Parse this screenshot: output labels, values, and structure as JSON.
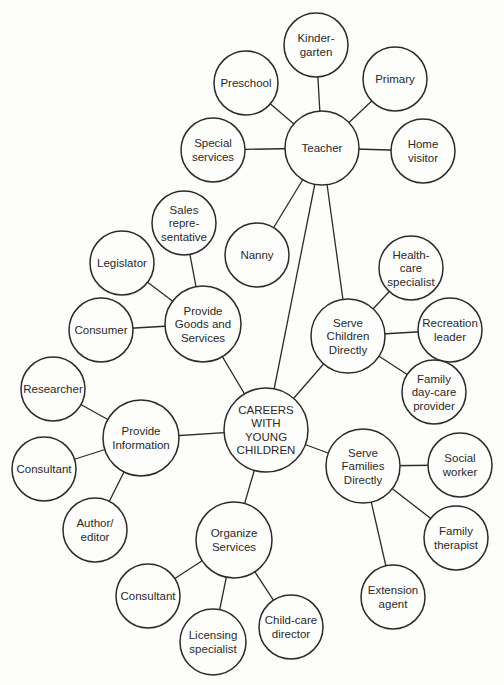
{
  "colors": {
    "line": "#2b2b2b",
    "background": "#fdfdfb",
    "text": "#2a2a2a"
  },
  "nodes": [
    {
      "id": "center",
      "lines": [
        "CAREERS",
        "WITH",
        "YOUNG",
        "CHILDREN"
      ]
    },
    {
      "id": "teacher",
      "lines": [
        "Teacher"
      ]
    },
    {
      "id": "kindergarten",
      "lines": [
        "Kinder-",
        "garten"
      ]
    },
    {
      "id": "preschool",
      "lines": [
        "Preschool"
      ]
    },
    {
      "id": "primary",
      "lines": [
        "Primary"
      ]
    },
    {
      "id": "special-services",
      "lines": [
        "Special",
        "services"
      ]
    },
    {
      "id": "home-visitor",
      "lines": [
        "Home",
        "visitor"
      ]
    },
    {
      "id": "nanny",
      "lines": [
        "Nanny"
      ]
    },
    {
      "id": "goods-services",
      "lines": [
        "Provide",
        "Goods and",
        "Services"
      ]
    },
    {
      "id": "sales-rep",
      "lines": [
        "Sales",
        "repre-",
        "sentative"
      ]
    },
    {
      "id": "legislator",
      "lines": [
        "Legislator"
      ]
    },
    {
      "id": "consumer",
      "lines": [
        "Consumer"
      ]
    },
    {
      "id": "serve-children",
      "lines": [
        "Serve",
        "Children",
        "Directly"
      ]
    },
    {
      "id": "health-care",
      "lines": [
        "Health-",
        "care",
        "specialist"
      ]
    },
    {
      "id": "recreation",
      "lines": [
        "Recreation",
        "leader"
      ]
    },
    {
      "id": "family-daycare",
      "lines": [
        "Family",
        "day-care",
        "provider"
      ]
    },
    {
      "id": "provide-info",
      "lines": [
        "Provide",
        "Information"
      ]
    },
    {
      "id": "researcher",
      "lines": [
        "Researcher"
      ]
    },
    {
      "id": "consultant-info",
      "lines": [
        "Consultant"
      ]
    },
    {
      "id": "author-editor",
      "lines": [
        "Author/",
        "editor"
      ]
    },
    {
      "id": "serve-families",
      "lines": [
        "Serve",
        "Families",
        "Directly"
      ]
    },
    {
      "id": "social-worker",
      "lines": [
        "Social",
        "worker"
      ]
    },
    {
      "id": "family-therapist",
      "lines": [
        "Family",
        "therapist"
      ]
    },
    {
      "id": "extension-agent",
      "lines": [
        "Extension",
        "agent"
      ]
    },
    {
      "id": "organize-services",
      "lines": [
        "Organize",
        "Services"
      ]
    },
    {
      "id": "consultant-org",
      "lines": [
        "Consultant"
      ]
    },
    {
      "id": "licensing",
      "lines": [
        "Licensing",
        "specialist"
      ]
    },
    {
      "id": "child-care-director",
      "lines": [
        "Child-care",
        "director"
      ]
    }
  ],
  "edges": [
    [
      "center",
      "teacher"
    ],
    [
      "center",
      "goods-services"
    ],
    [
      "center",
      "serve-children"
    ],
    [
      "center",
      "provide-info"
    ],
    [
      "center",
      "serve-families"
    ],
    [
      "center",
      "organize-services"
    ],
    [
      "teacher",
      "kindergarten"
    ],
    [
      "teacher",
      "preschool"
    ],
    [
      "teacher",
      "primary"
    ],
    [
      "teacher",
      "special-services"
    ],
    [
      "teacher",
      "home-visitor"
    ],
    [
      "teacher",
      "nanny"
    ],
    [
      "teacher",
      "serve-children"
    ],
    [
      "goods-services",
      "sales-rep"
    ],
    [
      "goods-services",
      "legislator"
    ],
    [
      "goods-services",
      "consumer"
    ],
    [
      "serve-children",
      "health-care"
    ],
    [
      "serve-children",
      "recreation"
    ],
    [
      "serve-children",
      "family-daycare"
    ],
    [
      "provide-info",
      "researcher"
    ],
    [
      "provide-info",
      "consultant-info"
    ],
    [
      "provide-info",
      "author-editor"
    ],
    [
      "serve-families",
      "social-worker"
    ],
    [
      "serve-families",
      "family-therapist"
    ],
    [
      "serve-families",
      "extension-agent"
    ],
    [
      "organize-services",
      "consultant-org"
    ],
    [
      "organize-services",
      "licensing"
    ],
    [
      "organize-services",
      "child-care-director"
    ]
  ]
}
